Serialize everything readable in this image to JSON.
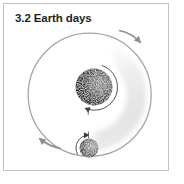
{
  "figure": {
    "title": "3.2 Earth days",
    "caption_meaning": "orbital period diagram",
    "bodies": {
      "planet": "central-planet",
      "moon": "orbiting-moon"
    },
    "motion": {
      "orbit_direction": "clockwise",
      "planet_rotation": "clockwise",
      "moon_rotation": "clockwise"
    },
    "colors": {
      "frame_border": "#c2c2c2",
      "background": "#ffffff",
      "title_text": "#1f1f1f",
      "orbit_stroke": "#a5a5a5",
      "orbit_arrow": "#8f8f8f",
      "rotation_arrow": "#3f3f3f",
      "axis_tick": "#555555",
      "trail_stop_faint": "#ececec",
      "trail_stop_mid": "#e3e3e3",
      "trail_stop_end": "#e9e9e9",
      "planet_stop_0": "#9a9a9a",
      "planet_stop_1": "#6e6e6e",
      "planet_stop_2": "#2f2f2f",
      "planet_stop_3": "#0a0a0a",
      "moon_stop_0": "#b2b2b2",
      "moon_stop_1": "#828282",
      "moon_stop_2": "#3a3a3a",
      "moon_stop_3": "#161616"
    }
  }
}
